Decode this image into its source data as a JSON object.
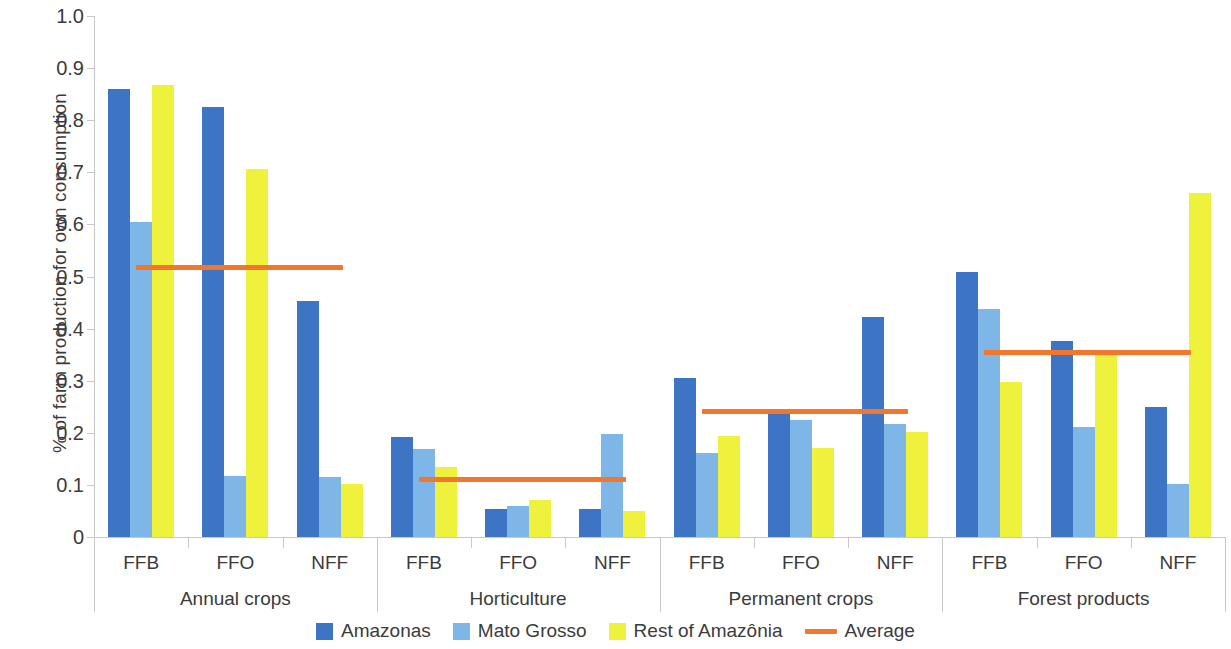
{
  "chart_data": {
    "type": "bar",
    "title": "",
    "xlabel": "",
    "ylabel": "% of farm production for own consumption",
    "ylim": [
      0,
      1.0
    ],
    "ytick_labels": [
      "1.0",
      "0.9",
      "0.8",
      "0.7",
      "0.6",
      "0.5",
      "0.4",
      "0.3",
      "0.2",
      "0.1",
      "0"
    ],
    "ytick_values": [
      1.0,
      0.9,
      0.8,
      0.7,
      0.6,
      0.5,
      0.4,
      0.3,
      0.2,
      0.1,
      0
    ],
    "grid": false,
    "legend_position": "bottom",
    "groups": [
      {
        "name": "Annual crops",
        "categories": [
          "FFB",
          "FFO",
          "NFF"
        ],
        "average": 0.517,
        "values": {
          "Amazonas": [
            0.859,
            0.826,
            0.453
          ],
          "Mato Grosso": [
            0.604,
            0.118,
            0.115
          ],
          "Rest of Amazônia": [
            0.867,
            0.706,
            0.102
          ]
        }
      },
      {
        "name": "Horticulture",
        "categories": [
          "FFB",
          "FFO",
          "NFF"
        ],
        "average": 0.11,
        "values": {
          "Amazonas": [
            0.192,
            0.053,
            0.053
          ],
          "Mato Grosso": [
            0.168,
            0.06,
            0.198
          ],
          "Rest of Amazônia": [
            0.134,
            0.071,
            0.05
          ]
        }
      },
      {
        "name": "Permanent crops",
        "categories": [
          "FFB",
          "FFO",
          "NFF"
        ],
        "average": 0.24,
        "values": {
          "Amazonas": [
            0.305,
            0.246,
            0.422
          ],
          "Mato Grosso": [
            0.162,
            0.224,
            0.216
          ],
          "Rest of Amazônia": [
            0.193,
            0.17,
            0.201
          ]
        }
      },
      {
        "name": "Forest products",
        "categories": [
          "FFB",
          "FFO",
          "NFF"
        ],
        "average": 0.355,
        "values": {
          "Amazonas": [
            0.508,
            0.377,
            0.25
          ],
          "Mato Grosso": [
            0.438,
            0.212,
            0.101
          ],
          "Rest of Amazônia": [
            0.298,
            0.352,
            0.66
          ]
        }
      }
    ],
    "series": [
      {
        "name": "Amazonas",
        "color": "#3d74c4"
      },
      {
        "name": "Mato Grosso",
        "color": "#7fb6e8"
      },
      {
        "name": "Rest of Amazônia",
        "color": "#eff23c"
      }
    ],
    "average_series": {
      "name": "Average",
      "color": "#f2762b"
    }
  },
  "legend": {
    "items": [
      {
        "label": "Amazonas",
        "type": "swatch",
        "color": "#3d74c4"
      },
      {
        "label": "Mato Grosso",
        "type": "swatch",
        "color": "#7fb6e8"
      },
      {
        "label": "Rest of Amazônia",
        "type": "swatch",
        "color": "#eff23c"
      },
      {
        "label": "Average",
        "type": "line",
        "color": "#f2762b"
      }
    ]
  }
}
